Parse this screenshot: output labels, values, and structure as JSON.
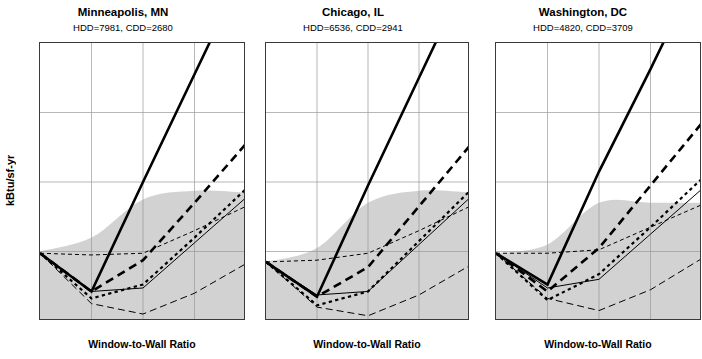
{
  "figure": {
    "ylabel": "kBtu/sf-yr",
    "xlabel": "Window-to-Wall Ratio"
  },
  "chart_data": {
    "type": "line",
    "title": "",
    "xlabel": "Window-to-Wall Ratio",
    "ylabel": "kBtu/sf-yr",
    "xlim": [
      0,
      0.6
    ],
    "ylim": [
      100,
      180
    ],
    "xticks": [
      0,
      0.15,
      0.3,
      0.45,
      0.6
    ],
    "xticklabels": [
      "0",
      "0.15",
      "0.30",
      "0.45",
      "0.60"
    ],
    "yticks": [
      100,
      120,
      140,
      160,
      180
    ],
    "yticklabels": [
      "100",
      "120",
      "140",
      "160",
      "180"
    ],
    "grid": true,
    "legend_position": "none",
    "shaded_band_color": "#d2d2d2",
    "line_color": "#000000",
    "panels": [
      {
        "title": "Minneapolis, MN",
        "subtitle": "HDD=7981, CDD=2680",
        "hdd": 7981,
        "cdd": 2680,
        "x": [
          0,
          0.15,
          0.3,
          0.45,
          0.6
        ],
        "band_upper": [
          120,
          124,
          135,
          137.5,
          137
        ],
        "band_lower": [
          100,
          100,
          100,
          100,
          100
        ],
        "series": [
          {
            "name": "thick-solid",
            "style": "solid",
            "width": 2.6,
            "values": [
              119.5,
              108.5,
              140,
              171,
              202
            ]
          },
          {
            "name": "thick-long-dash",
            "style": "long-dash",
            "width": 2.6,
            "values": [
              119.5,
              108.5,
              117.5,
              134,
              151
            ]
          },
          {
            "name": "medium-short-dash",
            "style": "short-dash",
            "width": 2.2,
            "values": [
              119.5,
              106.5,
              110.5,
              124,
              138
            ]
          },
          {
            "name": "thin-solid",
            "style": "solid",
            "width": 1.0,
            "values": [
              119.5,
              108.5,
              109.5,
              122.5,
              135.5
            ]
          },
          {
            "name": "thin-short-dash",
            "style": "short-dash",
            "width": 1.0,
            "values": [
              119.5,
              119,
              119.5,
              126,
              133
            ]
          },
          {
            "name": "thin-long-dash",
            "style": "long-dash",
            "width": 1.0,
            "values": [
              119.5,
              105,
              102,
              108,
              116.5
            ]
          }
        ]
      },
      {
        "title": "Chicago, IL",
        "subtitle": "HDD=6536, CDD=2941",
        "hdd": 6536,
        "cdd": 2941,
        "x": [
          0,
          0.15,
          0.3,
          0.45,
          0.6
        ],
        "band_upper": [
          117,
          121,
          134,
          137.5,
          137
        ],
        "band_lower": [
          100,
          100,
          100,
          100,
          100
        ],
        "series": [
          {
            "name": "thick-solid",
            "style": "solid",
            "width": 2.6,
            "values": [
              117,
              107,
              139,
              170,
              201
            ]
          },
          {
            "name": "thick-long-dash",
            "style": "long-dash",
            "width": 2.6,
            "values": [
              117,
              107,
              115.5,
              133,
              150.5
            ]
          },
          {
            "name": "medium-short-dash",
            "style": "short-dash",
            "width": 2.2,
            "values": [
              117,
              104.5,
              108.5,
              123,
              137.5
            ]
          },
          {
            "name": "thin-solid",
            "style": "solid",
            "width": 1.0,
            "values": [
              117,
              107.5,
              108.5,
              122,
              135.5
            ]
          },
          {
            "name": "thin-short-dash",
            "style": "short-dash",
            "width": 1.0,
            "values": [
              117,
              117.5,
              119.5,
              126,
              133
            ]
          },
          {
            "name": "thin-long-dash",
            "style": "long-dash",
            "width": 1.0,
            "values": [
              117,
              104,
              101.5,
              107.5,
              116
            ]
          }
        ]
      },
      {
        "title": "Washington, DC",
        "subtitle": "HDD=4820, CDD=3709",
        "hdd": 4820,
        "cdd": 3709,
        "x": [
          0,
          0.15,
          0.3,
          0.45,
          0.6
        ],
        "band_upper": [
          119.5,
          122,
          134,
          134,
          134
        ],
        "band_lower": [
          100,
          100,
          100,
          100,
          100
        ],
        "series": [
          {
            "name": "thick-solid",
            "style": "solid",
            "width": 2.6,
            "values": [
              119.5,
              110.5,
              143,
              172.5,
              203
            ]
          },
          {
            "name": "thick-long-dash",
            "style": "long-dash",
            "width": 2.6,
            "values": [
              119.5,
              108.5,
              121,
              139,
              157
            ]
          },
          {
            "name": "medium-short-dash",
            "style": "short-dash",
            "width": 2.2,
            "values": [
              119.5,
              106,
              113.5,
              127,
              141
            ]
          },
          {
            "name": "thin-solid",
            "style": "solid",
            "width": 1.0,
            "values": [
              119.5,
              109.5,
              112,
              125,
              138
            ]
          },
          {
            "name": "thin-short-dash",
            "style": "short-dash",
            "width": 1.0,
            "values": [
              119.5,
              119.5,
              120.5,
              127,
              133.5
            ]
          },
          {
            "name": "thin-long-dash",
            "style": "long-dash",
            "width": 1.0,
            "values": [
              119.5,
              106.5,
              103,
              109,
              118
            ]
          }
        ]
      }
    ]
  }
}
